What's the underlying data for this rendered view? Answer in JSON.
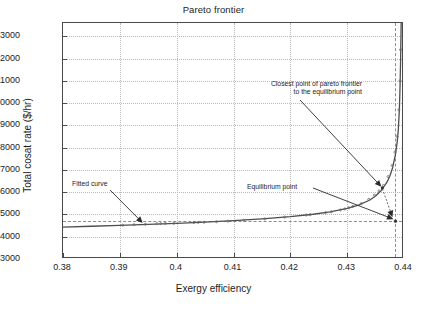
{
  "chart_data": {
    "type": "line",
    "title": "Pareto frontier",
    "xlabel": "Exergy efficiency",
    "ylabel": "Total cosat rate ($/hr)",
    "xlim": [
      0.38,
      0.44
    ],
    "ylim": [
      3000,
      13600
    ],
    "grid": true,
    "legend_position": "none",
    "xticks": [
      0.38,
      0.39,
      0.4,
      0.41,
      0.42,
      0.43,
      0.44
    ],
    "xticklabels": [
      "0.38",
      "0.39",
      "0.4",
      "0.41",
      "0.42",
      "0.43",
      "0.44"
    ],
    "yticks": [
      3000,
      4000,
      5000,
      6000,
      7000,
      8000,
      9000,
      10000,
      11000,
      12000,
      13000
    ],
    "yticklabels": [
      "3000",
      "4000",
      "5000",
      "6000",
      "7000",
      "8000",
      "9000",
      "10000",
      "11000",
      "12000",
      "13000"
    ],
    "series": [
      {
        "name": "Fitted curve",
        "style": "solid-line",
        "color": "#4d4d4d",
        "x": [
          0.38,
          0.385,
          0.39,
          0.395,
          0.4,
          0.405,
          0.41,
          0.415,
          0.42,
          0.424,
          0.427,
          0.43,
          0.432,
          0.434,
          0.435,
          0.436,
          0.437,
          0.4375,
          0.438,
          0.4385,
          0.4388,
          0.439,
          0.4392,
          0.4393,
          0.4394,
          0.4395
        ],
        "values": [
          4430,
          4470,
          4510,
          4555,
          4600,
          4655,
          4720,
          4800,
          4900,
          5010,
          5120,
          5270,
          5420,
          5650,
          5830,
          6080,
          6450,
          6720,
          7100,
          7700,
          8250,
          8800,
          9800,
          10700,
          11900,
          13600
        ]
      },
      {
        "name": "Pareto frontier data points",
        "style": "scatter-markers",
        "color": "#6b6b6b",
        "x": [
          0.3905,
          0.3925,
          0.3945,
          0.3965,
          0.3972,
          0.398,
          0.3995,
          0.403,
          0.4038,
          0.4048,
          0.407,
          0.409,
          0.4118,
          0.4155,
          0.419,
          0.4228,
          0.4235,
          0.4262,
          0.4272,
          0.4288,
          0.4296,
          0.4303,
          0.431,
          0.4325,
          0.4338,
          0.4348,
          0.4356,
          0.4364,
          0.4372,
          0.4379,
          0.4384,
          0.4388,
          0.4391,
          0.4393,
          0.4394
        ],
        "values": [
          4520,
          4540,
          4560,
          4585,
          4590,
          4595,
          4605,
          4640,
          4645,
          4650,
          4675,
          4700,
          4740,
          4800,
          4880,
          4975,
          4990,
          5080,
          5120,
          5200,
          5250,
          5300,
          5360,
          5490,
          5680,
          5870,
          6060,
          6300,
          6700,
          7200,
          7800,
          8500,
          9700,
          11000,
          12400
        ]
      }
    ],
    "reference_lines": {
      "horizontal_y": 4700,
      "vertical_x": 0.4385
    },
    "markers": [
      {
        "name": "closest-point",
        "label": "Closest point of pareto frontier to the equilibrium point",
        "x": 0.4362,
        "y": 6200
      },
      {
        "name": "equilibrium-point",
        "label": "Equilibrium point",
        "x": 0.4385,
        "y": 4700
      }
    ],
    "annotations": [
      {
        "name": "fitted-curve",
        "text": "Fitted curve",
        "target_x": 0.3942,
        "target_y": 4530
      },
      {
        "name": "closest-point-note",
        "line1": "Closest point of pareto frontier",
        "line2": "to the equilibrium point",
        "target_x": 0.4362,
        "target_y": 6200
      },
      {
        "name": "equilibrium-point-note",
        "text": "Equilibrium point",
        "target_x": 0.4385,
        "target_y": 4700
      }
    ]
  }
}
